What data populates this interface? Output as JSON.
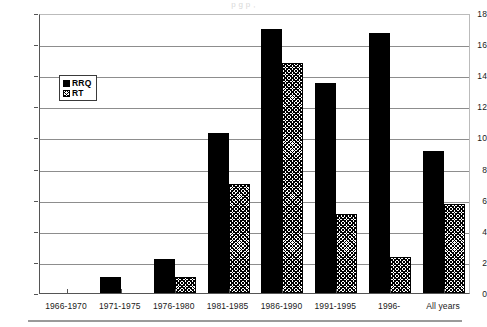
{
  "figure": {
    "top_bleed_text": "p                                        g                                       p                                          ,"
  },
  "legend": {
    "position": "inside-upper-left",
    "entries": [
      {
        "label": "RRQ",
        "pattern": "solid-black",
        "color": "#000000"
      },
      {
        "label": "RT",
        "pattern": "cross-hatch",
        "color": "#000000"
      }
    ]
  },
  "chart_data": {
    "type": "bar",
    "title": "",
    "xlabel": "",
    "ylabel": "",
    "ylim": [
      0,
      18
    ],
    "yticks": [
      0,
      2,
      4,
      6,
      8,
      10,
      12,
      14,
      16,
      18
    ],
    "grid": true,
    "legend_position": "inside-upper-left",
    "categories": [
      "1966-1970",
      "1971-1975",
      "1976-1980",
      "1981-1985",
      "1986-1990",
      "1991-1995",
      "1996-",
      "All years"
    ],
    "series": [
      {
        "name": "RRQ",
        "values": [
          0,
          1.0,
          2.2,
          10.3,
          17.0,
          13.5,
          16.7,
          9.1
        ]
      },
      {
        "name": "RT",
        "values": [
          0,
          0,
          1.0,
          7.0,
          14.8,
          5.1,
          2.3,
          5.7
        ]
      }
    ]
  }
}
